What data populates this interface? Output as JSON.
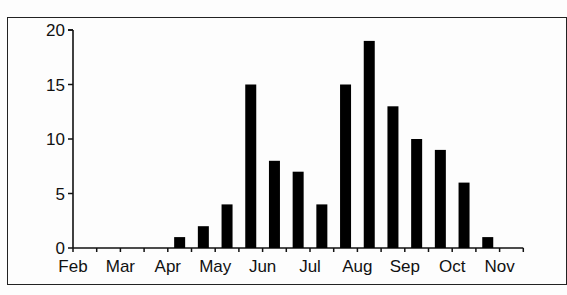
{
  "chart_data": {
    "type": "bar",
    "title": "",
    "xlabel": "",
    "ylabel": "",
    "ylim": [
      0,
      20
    ],
    "yticks": [
      0,
      5,
      10,
      15,
      20
    ],
    "xtick_labels": [
      "Feb",
      "Mar",
      "Apr",
      "May",
      "Jun",
      "Jul",
      "Aug",
      "Sep",
      "Oct",
      "Nov"
    ],
    "grid": false,
    "legend": null,
    "bar_color": "#000000",
    "categories": [
      "Feb-1",
      "Feb-2",
      "Mar-1",
      "Mar-2",
      "Apr-1",
      "Apr-2",
      "May-1",
      "May-2",
      "Jun-1",
      "Jun-2",
      "Jul-1",
      "Jul-2",
      "Aug-1",
      "Aug-2",
      "Sep-1",
      "Sep-2",
      "Oct-1",
      "Oct-2",
      "Nov-1"
    ],
    "values": [
      0,
      0,
      0,
      0,
      1,
      2,
      4,
      15,
      8,
      7,
      4,
      15,
      19,
      13,
      10,
      9,
      6,
      1,
      0
    ]
  }
}
